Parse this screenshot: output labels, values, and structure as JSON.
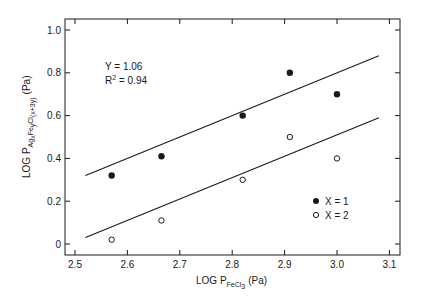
{
  "chart_data": {
    "type": "scatter",
    "title": "",
    "xlabel": "LOG P_FeCl3 (Pa)",
    "xlabel_parts": {
      "main": "LOG P",
      "sub": "FeCl",
      "subsub": "3",
      "unit": "(Pa)"
    },
    "ylabel": "LOG P_AgxFeyCl(x+3y) (Pa)",
    "ylabel_parts": {
      "main": "LOG P",
      "sub1": "Ag",
      "s1": "x",
      "sub2": "Fe",
      "s2": "y",
      "sub3": "Cl",
      "s3": "(x+3y)",
      "unit": "(Pa)"
    },
    "xlim": [
      2.48,
      3.12
    ],
    "ylim": [
      -0.03,
      1.03
    ],
    "x_ticks": [
      "2.5",
      "2.6",
      "2.7",
      "2.8",
      "2.9",
      "3.0",
      "3.1"
    ],
    "y_ticks": [
      "0",
      "0.2",
      "0.4",
      "0.6",
      "0.8",
      "1.0"
    ],
    "grid": false,
    "legend_position": "lower right",
    "series": [
      {
        "name": "X = 1",
        "marker": "filled-circle",
        "points": [
          {
            "x": 2.57,
            "y": 0.32
          },
          {
            "x": 2.665,
            "y": 0.41
          },
          {
            "x": 2.82,
            "y": 0.6
          },
          {
            "x": 2.91,
            "y": 0.8
          },
          {
            "x": 3.0,
            "y": 0.7
          }
        ],
        "fit_line": {
          "x": [
            2.52,
            3.08
          ],
          "y": [
            0.32,
            0.88
          ]
        }
      },
      {
        "name": "X = 2",
        "marker": "open-circle",
        "points": [
          {
            "x": 2.57,
            "y": 0.02
          },
          {
            "x": 2.665,
            "y": 0.11
          },
          {
            "x": 2.82,
            "y": 0.3
          },
          {
            "x": 2.91,
            "y": 0.5
          },
          {
            "x": 3.0,
            "y": 0.4
          }
        ],
        "fit_line": {
          "x": [
            2.52,
            3.08
          ],
          "y": [
            0.03,
            0.59
          ]
        }
      }
    ],
    "annotations": [
      {
        "text": "Y = 1.06"
      },
      {
        "text": "R2 = 0.94",
        "main": "R",
        "sup": "2",
        "rest": " = 0.94"
      }
    ]
  },
  "legend": {
    "items": [
      {
        "label": "X = 1",
        "marker": "filled-circle"
      },
      {
        "label": "X = 2",
        "marker": "open-circle"
      }
    ]
  },
  "annotation": {
    "line1": "Y = 1.06",
    "line2_main": "R",
    "line2_sup": "2",
    "line2_rest": " = 0.94"
  },
  "colors": {
    "ink": "#1a1a1a",
    "background": "#ffffff"
  }
}
